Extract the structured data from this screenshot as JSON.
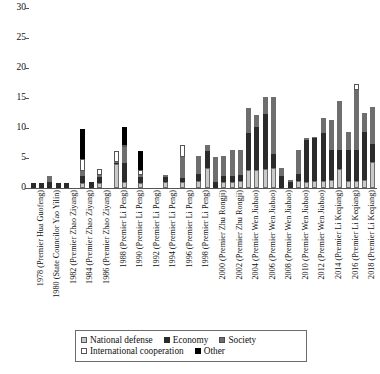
{
  "chart_data": {
    "type": "bar",
    "subtype": "stacked-vertical",
    "title": "",
    "xlabel": "",
    "ylabel": "",
    "ylim": [
      0,
      30
    ],
    "yticks": [
      0,
      5,
      10,
      15,
      20,
      25,
      30
    ],
    "grid": false,
    "legend_position": "bottom",
    "categories": [
      "1978 (Premier Hua Guofeng)",
      "1979",
      "1980 (State Councilor Yao Yilin)",
      "1981",
      "1982 (Premier Zhao Ziyang)",
      "1983",
      "1984 (Premier Zhao Ziyang)",
      "1985",
      "1986 (Premier Zhao Ziyang)",
      "1987",
      "1988 (Premier Li Peng)",
      "1989",
      "1990 (Premier Li Peng)",
      "1991",
      "1992 (Premier Li Peng)",
      "1993",
      "1994 (Premier Li Peng)",
      "1995",
      "1996 (Premier Li Peng)",
      "1997",
      "1998 (Premier Li Peng)",
      "1999",
      "2000 (Premier Zhu Rongji)",
      "2001",
      "2002 (Premier Zhu Rongji)",
      "2003",
      "2004 (Premier Wen Jiabao)",
      "2005",
      "2006 (Premier Wen Jiabao)",
      "2007",
      "2008 (Premier Wen Jiabao)",
      "2009",
      "2010 (Premier Wen Jiabao)",
      "2011",
      "2012 (Premier Wen Jiabao)",
      "2013",
      "2014 (Premier Li Keqiang)",
      "2015",
      "2016 (Premier Li Keqiang)",
      "2017",
      "2018 (Premier Li Keqiang)",
      "2019"
    ],
    "tick_labels": [
      "1978 (Premier Hua Guofeng)",
      "1980 (State Councilor Yao Yilin)",
      "1982 (Premier Zhao Ziyang)",
      "1984 (Premier Zhao Ziyang)",
      "1986 (Premier Zhao Ziyang)",
      "1988 (Premier Li Peng)",
      "1990 (Premier Li Peng)",
      "1992 (Premier Li Peng)",
      "1994 (Premier Li Peng)",
      "1996 (Premier Li Peng)",
      "1998 (Premier Li Peng)",
      "2000 (Premier Zhu Rongji)",
      "2002 (Premier Zhu Rongji)",
      "2004 (Premier Wen Jiabao)",
      "2006 (Premier Wen Jiabao)",
      "2008 (Premier Wen Jiabao)",
      "2010 (Premier Wen Jiabao)",
      "2012 (Premier Wen Jiabao)",
      "2014 (Premier Li Keqiang)",
      "2016 (Premier Li Keqiang)",
      "2018 (Premier Li Keqiang)"
    ],
    "series": [
      {
        "name": "National defense",
        "color": "#c9c9c9",
        "values": [
          0,
          0,
          0,
          0,
          0,
          0,
          0.9,
          0,
          0.9,
          0,
          4,
          1,
          0,
          0.9,
          0,
          0,
          1,
          0,
          1,
          0,
          1.2,
          3.3,
          0,
          1,
          1,
          1.2,
          3,
          3,
          3.2,
          3.3,
          0,
          0,
          1.2,
          1,
          1.2,
          1.2,
          1.3,
          3.2,
          1.2,
          1.2,
          1.4,
          4.4
        ]
      },
      {
        "name": "Economy",
        "color": "#2b2b2b",
        "values": [
          0.9,
          0.9,
          1,
          0.9,
          0.9,
          0,
          1.1,
          1,
          1,
          0,
          0.2,
          3.2,
          0,
          0.9,
          0,
          0,
          0.9,
          0,
          0.6,
          0,
          1.1,
          2.9,
          1,
          1,
          1,
          1,
          6.2,
          7.2,
          9.2,
          2.4,
          2,
          1,
          1.1,
          7,
          7.2,
          7.9,
          5.1,
          3.2,
          5.1,
          5.1,
          8,
          3
        ]
      },
      {
        "name": "Society",
        "color": "#6e6e6e",
        "values": [
          0,
          0,
          1,
          0,
          0,
          0,
          0.9,
          0,
          0.3,
          0,
          0.2,
          2.6,
          0,
          0.3,
          0,
          0,
          0.3,
          0,
          3.6,
          0,
          3,
          1,
          4.2,
          3.3,
          4.3,
          4.1,
          4.1,
          2,
          2.8,
          9.5,
          1.3,
          0.3,
          4.1,
          0.3,
          0.1,
          2.6,
          5,
          8.1,
          3.1,
          10.1,
          3.1,
          6.1
        ]
      },
      {
        "name": "International cooperation",
        "color": "#ffffff",
        "values": [
          0,
          0,
          0,
          0,
          0,
          0,
          2,
          0,
          1,
          0,
          1.7,
          0.3,
          0,
          0.9,
          0,
          0,
          0,
          0,
          2,
          0,
          0,
          0,
          0,
          0,
          0,
          0,
          0,
          0,
          0,
          0,
          0,
          0,
          0,
          0,
          0,
          0,
          0,
          0,
          0,
          1,
          0,
          0
        ]
      },
      {
        "name": "Other",
        "color": "#000000",
        "values": [
          0,
          0,
          0,
          0,
          0,
          0,
          5,
          0,
          0,
          0,
          0,
          3.1,
          0,
          3.1,
          0,
          0,
          0,
          0,
          0,
          0,
          0,
          0,
          0,
          0,
          0,
          0,
          0,
          0,
          0,
          0,
          0,
          0,
          0,
          0,
          0,
          0,
          0,
          0,
          0,
          0,
          0,
          0
        ]
      }
    ],
    "totals": [
      0.9,
      0.9,
      2,
      0.9,
      0.9,
      0,
      9.2,
      1,
      3.2,
      0,
      6.1,
      7.2,
      0,
      2.2,
      0,
      0,
      2.2,
      0,
      7.2,
      0,
      2.3,
      5.3,
      5.2,
      5.3,
      6.3,
      6.3,
      5.2,
      5.3,
      10.3,
      11.2,
      3.3,
      1.3,
      15.2,
      13.3,
      25.1,
      3.4,
      1.4,
      6.4,
      2.4,
      10.4,
      8.5,
      13.5
    ],
    "legend": [
      "National defense",
      "Economy",
      "Society",
      "International cooperation",
      "Other"
    ]
  }
}
